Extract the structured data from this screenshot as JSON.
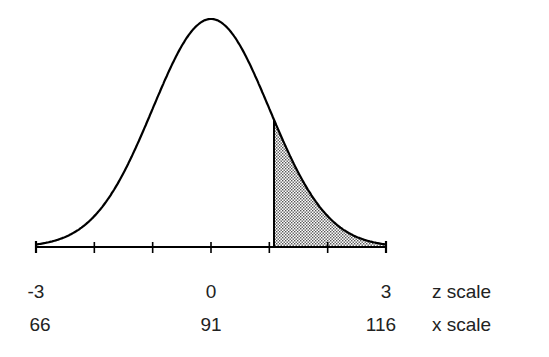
{
  "chart_data": {
    "type": "area",
    "title": "",
    "distribution": {
      "mean": 91,
      "sd": 8.333
    },
    "shaded_region": {
      "z_from": 1.08,
      "z_to": 3,
      "x_from": 100,
      "x_to": 116,
      "fill": "#b0b0b0",
      "pattern": "dotted"
    },
    "z_ticks": [
      -3,
      -2,
      -1,
      0,
      1,
      2,
      3
    ],
    "z_tick_labels": [
      {
        "z": -3,
        "label": "-3"
      },
      {
        "z": 0,
        "label": "0"
      },
      {
        "z": 3,
        "label": "3"
      }
    ],
    "x_tick_labels": [
      {
        "z": -3,
        "label": "66"
      },
      {
        "z": 0,
        "label": "91"
      },
      {
        "z": 3,
        "label": "116"
      }
    ],
    "xlabel_z": "z scale",
    "xlabel_x": "x scale",
    "xlim_z": [
      -3,
      3
    ],
    "xlim_x": [
      66,
      116
    ],
    "grid": false,
    "legend": null,
    "colors": {
      "line": "#000000",
      "background": "#ffffff"
    }
  },
  "labels": {
    "z_scale": "z scale",
    "x_scale": "x scale",
    "z_minus3": "-3",
    "z_0": "0",
    "z_3": "3",
    "x_66": "66",
    "x_91": "91",
    "x_116": "116"
  }
}
